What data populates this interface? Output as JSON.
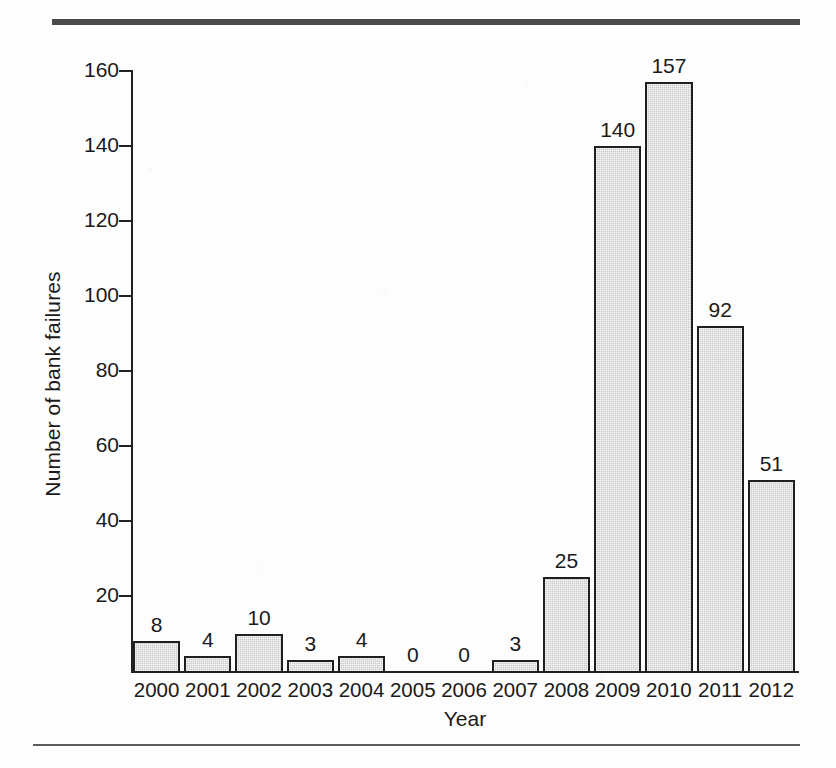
{
  "figure": {
    "top_rule": "thick-dark-rule",
    "bottom_rule": "thin-rule"
  },
  "chart_data": {
    "type": "bar",
    "title": "",
    "xlabel": "Year",
    "ylabel": "Number of bank failures",
    "categories": [
      "2000",
      "2001",
      "2002",
      "2003",
      "2004",
      "2005",
      "2006",
      "2007",
      "2008",
      "2009",
      "2010",
      "2011",
      "2012"
    ],
    "values": [
      8,
      4,
      10,
      3,
      4,
      0,
      0,
      3,
      25,
      140,
      157,
      92,
      51
    ],
    "value_labels": [
      "8",
      "4",
      "10",
      "3",
      "4",
      "0",
      "0",
      "3",
      "25",
      "140",
      "157",
      "92",
      "51"
    ],
    "ylim": [
      0,
      160
    ],
    "ytick_values": [
      0,
      20,
      40,
      60,
      80,
      100,
      120,
      140,
      160
    ],
    "ytick_labels": [
      "",
      "20",
      "40",
      "60",
      "80",
      "100",
      "120",
      "140",
      "160"
    ],
    "grid": false,
    "legend": null,
    "bar_fill_color": "#c9c9c9",
    "bar_edge_color": "#1f1f1f",
    "background_color": "#fdfdfd"
  }
}
